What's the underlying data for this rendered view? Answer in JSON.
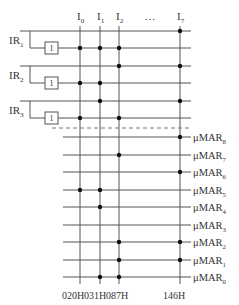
{
  "diagram": {
    "columns": [
      {
        "label": "I",
        "sub": "0",
        "x": 80,
        "address": "020H"
      },
      {
        "label": "I",
        "sub": "1",
        "x": 100,
        "address": "031H"
      },
      {
        "label": "I",
        "sub": "2",
        "x": 119,
        "address": "087H"
      },
      {
        "label": "I",
        "sub": "7",
        "x": 180,
        "address": "146H"
      }
    ],
    "ellipsis": "…",
    "ir_groups": [
      {
        "label": "IR",
        "sub": "1",
        "top_y": 31,
        "bottom_y": 48,
        "gate_label": "1"
      },
      {
        "label": "IR",
        "sub": "2",
        "top_y": 66,
        "bottom_y": 83,
        "gate_label": "1"
      },
      {
        "label": "IR",
        "sub": "3",
        "top_y": 101,
        "bottom_y": 118,
        "gate_label": "1"
      }
    ],
    "input_rows": [
      {
        "y": 31,
        "dots": [
          180
        ]
      },
      {
        "y": 48,
        "dots": [
          80,
          100,
          119
        ]
      },
      {
        "y": 66,
        "dots": [
          119,
          180
        ]
      },
      {
        "y": 83,
        "dots": [
          80,
          100
        ]
      },
      {
        "y": 101,
        "dots": [
          100,
          180
        ]
      },
      {
        "y": 118,
        "dots": [
          80,
          119
        ]
      }
    ],
    "output_rows": [
      {
        "label": "μMAR",
        "sub": "8",
        "y": 137,
        "dots": [
          180
        ]
      },
      {
        "label": "μMAR",
        "sub": "7",
        "y": 155,
        "dots": [
          119
        ]
      },
      {
        "label": "μMAR",
        "sub": "6",
        "y": 172,
        "dots": [
          180
        ]
      },
      {
        "label": "μMAR",
        "sub": "5",
        "y": 190,
        "dots": [
          80,
          100
        ]
      },
      {
        "label": "μMAR",
        "sub": "4",
        "y": 207,
        "dots": [
          100
        ]
      },
      {
        "label": "μMAR",
        "sub": "3",
        "y": 225,
        "dots": []
      },
      {
        "label": "μMAR",
        "sub": "2",
        "y": 242,
        "dots": [
          119,
          180
        ]
      },
      {
        "label": "μMAR",
        "sub": "1",
        "y": 260,
        "dots": [
          119,
          180
        ]
      },
      {
        "label": "μMAR",
        "sub": "0",
        "y": 277,
        "dots": [
          100,
          119
        ]
      }
    ],
    "colors": {
      "line": "#555555",
      "dot": "#111111",
      "dash": "#777777"
    }
  }
}
